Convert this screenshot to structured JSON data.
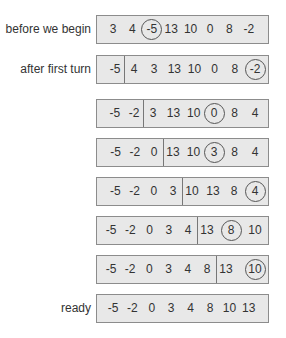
{
  "rows": [
    {
      "label": "before we begin",
      "values": [
        "3",
        "4",
        "-5",
        "13",
        "10",
        "0",
        "8",
        "-2"
      ],
      "circled": 2,
      "sorted_count": 0
    },
    {
      "label": "after first turn",
      "values": [
        "-5",
        "4",
        "3",
        "13",
        "10",
        "0",
        "8",
        "-2"
      ],
      "circled": 7,
      "sorted_count": 1
    },
    {
      "label": "",
      "values": [
        "-5",
        "-2",
        "3",
        "13",
        "10",
        "0",
        "8",
        "4"
      ],
      "circled": 5,
      "sorted_count": 2
    },
    {
      "label": "",
      "values": [
        "-5",
        "-2",
        "0",
        "13",
        "10",
        "3",
        "8",
        "4"
      ],
      "circled": 5,
      "sorted_count": 3
    },
    {
      "label": "",
      "values": [
        "-5",
        "-2",
        "0",
        "3",
        "10",
        "13",
        "8",
        "4"
      ],
      "circled": 7,
      "sorted_count": 4
    },
    {
      "label": "",
      "values": [
        "-5",
        "-2",
        "0",
        "3",
        "4",
        "13",
        "8",
        "10"
      ],
      "circled": 6,
      "sorted_count": 5
    },
    {
      "label": "",
      "values": [
        "-5",
        "-2",
        "0",
        "3",
        "4",
        "8",
        "13",
        "10"
      ],
      "circled": 7,
      "sorted_count": 6
    },
    {
      "label": "ready",
      "values": [
        "-5",
        "-2",
        "0",
        "3",
        "4",
        "8",
        "10",
        "13"
      ],
      "circled": -1,
      "sorted_count": 0
    }
  ],
  "colors": {
    "box_fill": "#e8e8e8",
    "box_border": "#8c8c8c",
    "text": "#333333",
    "circle": "#555555"
  }
}
